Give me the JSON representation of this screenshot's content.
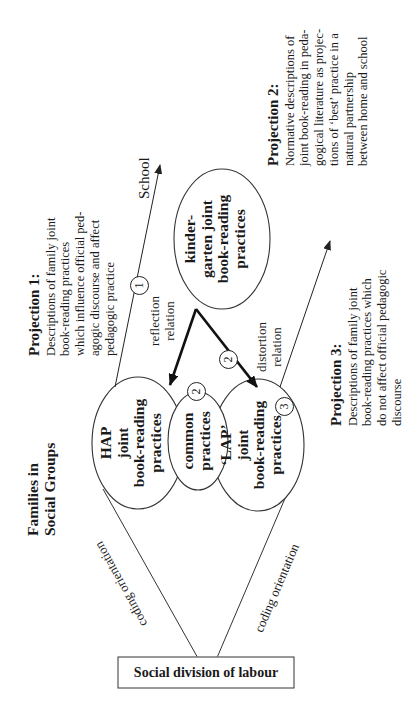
{
  "diagram": {
    "social_division": {
      "label": "Social division of labour"
    },
    "coding_orientation": {
      "upper": "coding orientation",
      "lower": "coding orientation"
    },
    "families": {
      "label": "Families in Social Groups"
    },
    "ellipses": {
      "hap": {
        "line1": "HAP",
        "line2": "joint",
        "line3": "book-reading",
        "line4": "practices"
      },
      "common": {
        "line1": "common",
        "line2": "practices"
      },
      "lap": {
        "line1": "‘LAP’",
        "line2": "joint",
        "line3": "book-reading",
        "line4": "practices"
      },
      "kindergarten": {
        "line1": "kinder-",
        "line2": "garten joint",
        "line3": "book-reading",
        "line4": "practices"
      }
    },
    "school": {
      "label": "School"
    },
    "relations": {
      "reflection": {
        "line1": "reflection",
        "line2": "relation"
      },
      "distortion": {
        "line1": "distortion",
        "line2": "relation"
      }
    },
    "markers": {
      "one": "1",
      "two_a": "2",
      "two_b": "2",
      "three": "3"
    },
    "projections": [
      {
        "title": "Projection 1:",
        "lines": [
          "Descriptions of family joint",
          "book-reading practices",
          "which influence official ped-",
          "agogic discourse and affect",
          "pedagogic practice"
        ]
      },
      {
        "title": "Projection 2:",
        "lines": [
          "Normative descriptions of",
          "joint book-reading in peda-",
          "gogical literature as projec-",
          "tions of ‘best’ practice in a",
          "natural partnership",
          "between home and school"
        ]
      },
      {
        "title": "Projection 3:",
        "lines": [
          "Descriptions of family joint",
          "book-reading practices which",
          "do not affect official pedagogic",
          "discourse"
        ]
      }
    ],
    "colors": {
      "line": "#222222",
      "background": "#ffffff"
    }
  }
}
